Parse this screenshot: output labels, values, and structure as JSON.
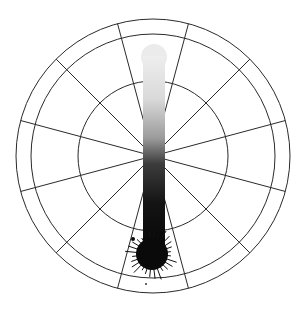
{
  "diagram": {
    "center": [
      153,
      156
    ],
    "rings": [
      {
        "name": "inner",
        "radius": 75
      },
      {
        "name": "middle",
        "radius": 122
      },
      {
        "name": "outer",
        "radius": 137
      }
    ],
    "spokes": {
      "count": 12,
      "start_angle_deg": 15,
      "step_deg": 30,
      "inner_radius": 0,
      "outer_radius": 137
    },
    "stroke": {
      "x": 154,
      "y_top": 55,
      "y_bottom": 254,
      "width": 22,
      "gradient": [
        "#eeeeee",
        "#d6d6d6",
        "#9a9a9a",
        "#3a3a3a",
        "#111111",
        "#050505"
      ],
      "top_blob": {
        "cx": 154,
        "cy": 56,
        "r": 13,
        "color": "#ebebeb"
      },
      "bottom_blob": {
        "cx": 152,
        "cy": 254,
        "r": 16,
        "color": "#0a0a0a"
      }
    },
    "colors": {
      "background": "#ffffff",
      "grid_line": "#2a2a2a",
      "ink_dark": "#0a0a0a",
      "ink_light": "#ebebeb"
    }
  }
}
